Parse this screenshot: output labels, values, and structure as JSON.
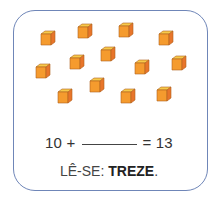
{
  "cubes": {
    "count": 13,
    "colors": {
      "top": "#f7c94a",
      "front": "#f59b2e",
      "side": "#e8752a",
      "outline": "#b0621e"
    },
    "positions": [
      [
        40,
        30
      ],
      [
        77,
        23
      ],
      [
        118,
        22
      ],
      [
        158,
        30
      ],
      [
        69,
        54
      ],
      [
        100,
        46
      ],
      [
        134,
        59
      ],
      [
        171,
        55
      ],
      [
        35,
        63
      ],
      [
        57,
        88
      ],
      [
        89,
        77
      ],
      [
        120,
        88
      ],
      [
        156,
        86
      ]
    ]
  },
  "equation": {
    "left": "10 +",
    "right": "= 13"
  },
  "reading": {
    "prefix": "LÊ-SE:",
    "word": "TREZE",
    "suffix": "."
  }
}
